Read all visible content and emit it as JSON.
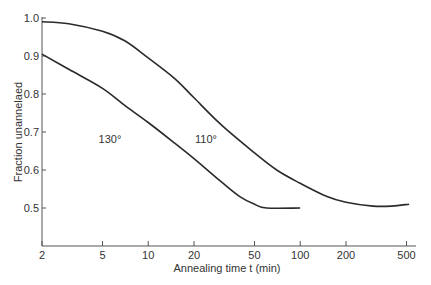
{
  "chart_data": {
    "type": "line",
    "title": "",
    "xlabel": "Annealing time t (min)",
    "ylabel": "Fraction unannelaed",
    "xscale": "log",
    "xlim": [
      2,
      550
    ],
    "ylim": [
      0.4,
      1.0
    ],
    "grid": false,
    "legend": "inline labels",
    "xticks": [
      2,
      5,
      10,
      20,
      50,
      100,
      200,
      500
    ],
    "xtick_labels": [
      "2",
      "5",
      "10",
      "20",
      "50",
      "100",
      "200",
      "500"
    ],
    "yticks": [
      0.5,
      0.6,
      0.7,
      0.8,
      0.9,
      1.0
    ],
    "ytick_labels": [
      "0.5",
      "0.6",
      "0.7",
      "0.8",
      "0.9",
      "1.0"
    ],
    "series": [
      {
        "name": "110°",
        "label_pos": {
          "t": 24,
          "v": 0.67
        },
        "x": [
          2,
          3,
          5,
          7,
          10,
          15,
          20,
          30,
          50,
          70,
          100,
          150,
          200,
          300,
          400,
          520
        ],
        "values": [
          0.99,
          0.985,
          0.965,
          0.94,
          0.895,
          0.84,
          0.79,
          0.72,
          0.645,
          0.6,
          0.565,
          0.53,
          0.515,
          0.505,
          0.505,
          0.51
        ]
      },
      {
        "name": "130°",
        "label_pos": {
          "t": 5.6,
          "v": 0.67
        },
        "x": [
          2,
          3,
          5,
          7,
          10,
          15,
          20,
          30,
          40,
          50,
          60,
          100
        ],
        "values": [
          0.905,
          0.865,
          0.815,
          0.77,
          0.725,
          0.67,
          0.63,
          0.57,
          0.53,
          0.51,
          0.5,
          0.5
        ]
      }
    ],
    "colors": {
      "line": "#2a2a2a",
      "axis": "#555555",
      "text": "#333333"
    }
  }
}
